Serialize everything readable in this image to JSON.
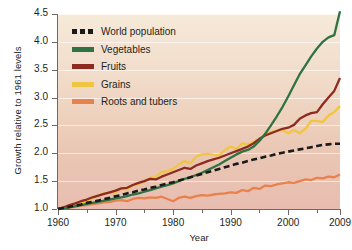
{
  "chart_data": {
    "type": "line",
    "title": "",
    "xlabel": "Year",
    "ylabel": "Growth relative to 1961 levels",
    "xlim": [
      1960,
      2009
    ],
    "ylim": [
      1.0,
      4.5
    ],
    "grid": true,
    "legend_position": "top-left",
    "xticks": [
      "1960",
      "1970",
      "1980",
      "1990",
      "2000",
      "2009"
    ],
    "xtick_values": [
      1960,
      1970,
      1980,
      1990,
      2000,
      2009
    ],
    "xminor_ticks": [
      1965,
      1975,
      1985,
      1995,
      2005
    ],
    "yticks": [
      "1.0",
      "1.5",
      "2.0",
      "2.5",
      "3.0",
      "3.5",
      "4.0",
      "4.5"
    ],
    "ytick_values": [
      1.0,
      1.5,
      2.0,
      2.5,
      3.0,
      3.5,
      4.0,
      4.5
    ],
    "x": [
      1960,
      1961,
      1962,
      1963,
      1964,
      1965,
      1966,
      1967,
      1968,
      1969,
      1970,
      1971,
      1972,
      1973,
      1974,
      1975,
      1976,
      1977,
      1978,
      1979,
      1980,
      1981,
      1982,
      1983,
      1984,
      1985,
      1986,
      1987,
      1988,
      1989,
      1990,
      1991,
      1992,
      1993,
      1994,
      1995,
      1996,
      1997,
      1998,
      1999,
      2000,
      2001,
      2002,
      2003,
      2004,
      2005,
      2006,
      2007,
      2008,
      2009
    ],
    "series": [
      {
        "name": "World population",
        "color": "#1a1a1a",
        "style": "dashed",
        "values": [
          1.0,
          1.02,
          1.04,
          1.06,
          1.08,
          1.11,
          1.13,
          1.15,
          1.18,
          1.2,
          1.23,
          1.25,
          1.28,
          1.3,
          1.33,
          1.35,
          1.38,
          1.4,
          1.43,
          1.46,
          1.48,
          1.51,
          1.54,
          1.57,
          1.6,
          1.63,
          1.66,
          1.69,
          1.72,
          1.75,
          1.78,
          1.81,
          1.83,
          1.86,
          1.89,
          1.91,
          1.94,
          1.96,
          1.99,
          2.01,
          2.03,
          2.05,
          2.07,
          2.09,
          2.11,
          2.13,
          2.15,
          2.16,
          2.17,
          2.17
        ]
      },
      {
        "name": "Vegetables",
        "color": "#2f7244",
        "style": "solid",
        "values": [
          1.0,
          1.01,
          1.03,
          1.05,
          1.07,
          1.09,
          1.11,
          1.13,
          1.15,
          1.17,
          1.19,
          1.21,
          1.23,
          1.26,
          1.28,
          1.31,
          1.34,
          1.37,
          1.4,
          1.43,
          1.46,
          1.5,
          1.54,
          1.57,
          1.61,
          1.65,
          1.7,
          1.75,
          1.8,
          1.86,
          1.92,
          1.98,
          2.03,
          2.06,
          2.12,
          2.22,
          2.35,
          2.5,
          2.66,
          2.83,
          3.02,
          3.22,
          3.42,
          3.58,
          3.74,
          3.88,
          4.0,
          4.08,
          4.12,
          4.55
        ]
      },
      {
        "name": "Fruits",
        "color": "#8e2b20",
        "style": "solid",
        "values": [
          1.0,
          1.03,
          1.07,
          1.1,
          1.14,
          1.17,
          1.21,
          1.24,
          1.27,
          1.3,
          1.33,
          1.37,
          1.38,
          1.43,
          1.47,
          1.5,
          1.54,
          1.53,
          1.58,
          1.62,
          1.66,
          1.7,
          1.74,
          1.72,
          1.78,
          1.82,
          1.86,
          1.89,
          1.92,
          1.96,
          2.0,
          2.04,
          2.08,
          2.12,
          2.18,
          2.26,
          2.32,
          2.36,
          2.4,
          2.44,
          2.46,
          2.51,
          2.62,
          2.68,
          2.72,
          2.74,
          2.88,
          3.0,
          3.12,
          3.35
        ]
      },
      {
        "name": "Grains",
        "color": "#f0c53f",
        "style": "solid",
        "values": [
          1.0,
          1.03,
          1.07,
          1.09,
          1.13,
          1.12,
          1.2,
          1.24,
          1.28,
          1.29,
          1.3,
          1.37,
          1.35,
          1.43,
          1.44,
          1.5,
          1.56,
          1.58,
          1.66,
          1.68,
          1.72,
          1.8,
          1.86,
          1.82,
          1.94,
          1.98,
          1.99,
          1.97,
          1.96,
          2.06,
          2.12,
          2.08,
          2.18,
          2.16,
          2.2,
          2.26,
          2.34,
          2.38,
          2.4,
          2.42,
          2.36,
          2.42,
          2.36,
          2.44,
          2.58,
          2.58,
          2.56,
          2.68,
          2.74,
          2.85
        ]
      },
      {
        "name": "Roots and tubers",
        "color": "#e8814c",
        "style": "solid",
        "values": [
          1.0,
          1.01,
          1.03,
          1.04,
          1.06,
          1.07,
          1.09,
          1.1,
          1.12,
          1.13,
          1.15,
          1.16,
          1.14,
          1.18,
          1.2,
          1.19,
          1.21,
          1.2,
          1.22,
          1.18,
          1.14,
          1.2,
          1.22,
          1.2,
          1.23,
          1.25,
          1.24,
          1.26,
          1.27,
          1.28,
          1.3,
          1.29,
          1.34,
          1.32,
          1.38,
          1.36,
          1.42,
          1.41,
          1.44,
          1.46,
          1.48,
          1.47,
          1.5,
          1.53,
          1.52,
          1.56,
          1.55,
          1.58,
          1.57,
          1.62
        ]
      }
    ]
  },
  "legend": {
    "items": [
      {
        "label": "World population"
      },
      {
        "label": "Vegetables"
      },
      {
        "label": "Fruits"
      },
      {
        "label": "Grains"
      },
      {
        "label": "Roots and tubers"
      }
    ]
  }
}
